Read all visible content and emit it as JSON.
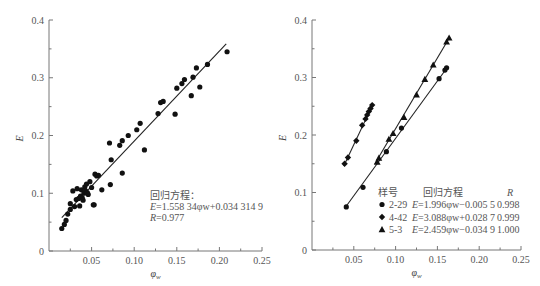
{
  "chart_data": [
    {
      "type": "scatter",
      "panel": "left",
      "title": "",
      "xlabel": "φw",
      "ylabel": "E",
      "xlim": [
        0,
        0.25
      ],
      "ylim": [
        0,
        0.4
      ],
      "xticks": [
        "0.05",
        "0.10",
        "0.15",
        "0.20",
        "0.25"
      ],
      "yticks": [
        "0",
        "0.1",
        "0.2",
        "0.3",
        "0.4"
      ],
      "grid": false,
      "series": [
        {
          "name": "data",
          "marker": "circle",
          "points": [
            [
              0.015,
              0.039
            ],
            [
              0.018,
              0.046
            ],
            [
              0.02,
              0.053
            ],
            [
              0.022,
              0.064
            ],
            [
              0.025,
              0.072
            ],
            [
              0.025,
              0.082
            ],
            [
              0.028,
              0.104
            ],
            [
              0.03,
              0.077
            ],
            [
              0.032,
              0.089
            ],
            [
              0.033,
              0.108
            ],
            [
              0.035,
              0.091
            ],
            [
              0.036,
              0.078
            ],
            [
              0.037,
              0.095
            ],
            [
              0.038,
              0.106
            ],
            [
              0.039,
              0.092
            ],
            [
              0.04,
              0.088
            ],
            [
              0.041,
              0.1
            ],
            [
              0.042,
              0.111
            ],
            [
              0.043,
              0.104
            ],
            [
              0.044,
              0.116
            ],
            [
              0.045,
              0.101
            ],
            [
              0.046,
              0.098
            ],
            [
              0.048,
              0.12
            ],
            [
              0.05,
              0.11
            ],
            [
              0.052,
              0.08
            ],
            [
              0.053,
              0.08
            ],
            [
              0.054,
              0.133
            ],
            [
              0.056,
              0.13
            ],
            [
              0.058,
              0.131
            ],
            [
              0.062,
              0.106
            ],
            [
              0.071,
              0.187
            ],
            [
              0.072,
              0.115
            ],
            [
              0.073,
              0.158
            ],
            [
              0.083,
              0.183
            ],
            [
              0.086,
              0.191
            ],
            [
              0.086,
              0.135
            ],
            [
              0.093,
              0.2
            ],
            [
              0.103,
              0.21
            ],
            [
              0.107,
              0.221
            ],
            [
              0.112,
              0.175
            ],
            [
              0.128,
              0.238
            ],
            [
              0.131,
              0.257
            ],
            [
              0.134,
              0.259
            ],
            [
              0.148,
              0.237
            ],
            [
              0.15,
              0.282
            ],
            [
              0.156,
              0.29
            ],
            [
              0.159,
              0.297
            ],
            [
              0.167,
              0.269
            ],
            [
              0.169,
              0.301
            ],
            [
              0.173,
              0.317
            ],
            [
              0.177,
              0.284
            ],
            [
              0.186,
              0.323
            ],
            [
              0.209,
              0.345
            ]
          ]
        }
      ],
      "fit_line": {
        "x": [
          0.015,
          0.208
        ],
        "slope": 1.55834,
        "intercept": 0.0343149
      },
      "annotations": {
        "title": "回归方程：",
        "equation_prefix": "E",
        "equation": "=1.558 34φw+0.034 314 9",
        "r_prefix": "R",
        "r_value": "=0.977"
      }
    },
    {
      "type": "scatter",
      "panel": "right",
      "title": "",
      "xlabel": "φw",
      "ylabel": "E",
      "xlim": [
        0,
        0.25
      ],
      "ylim": [
        0,
        0.4
      ],
      "xticks": [
        "0.05",
        "0.10",
        "0.15",
        "0.20",
        "0.25"
      ],
      "yticks": [
        "0",
        "0.1",
        "0.2",
        "0.3",
        "0.4"
      ],
      "grid": false,
      "series": [
        {
          "name": "2-29",
          "marker": "circle",
          "equation": "E=1.996φw−0.005 5",
          "R": "0.998",
          "points": [
            [
              0.041,
              0.075
            ],
            [
              0.061,
              0.109
            ],
            [
              0.089,
              0.171
            ],
            [
              0.107,
              0.212
            ],
            [
              0.152,
              0.298
            ],
            [
              0.159,
              0.313
            ],
            [
              0.161,
              0.317
            ]
          ],
          "fit_line": {
            "x": [
              0.04,
              0.162
            ],
            "slope": 1.996,
            "intercept": -0.0055
          }
        },
        {
          "name": "4-42",
          "marker": "diamond",
          "equation": "E=3.088φw+0.028 7",
          "R": "0.999",
          "points": [
            [
              0.039,
              0.15
            ],
            [
              0.043,
              0.161
            ],
            [
              0.053,
              0.19
            ],
            [
              0.06,
              0.217
            ],
            [
              0.064,
              0.228
            ],
            [
              0.066,
              0.235
            ],
            [
              0.068,
              0.241
            ],
            [
              0.07,
              0.246
            ],
            [
              0.072,
              0.252
            ]
          ],
          "fit_line": {
            "x": [
              0.038,
              0.073
            ],
            "slope": 3.088,
            "intercept": 0.0287
          }
        },
        {
          "name": "5-3",
          "marker": "triangle",
          "equation": "E=2.459φw−0.034 9",
          "R": "1.000",
          "points": [
            [
              0.078,
              0.153
            ],
            [
              0.08,
              0.16
            ],
            [
              0.092,
              0.193
            ],
            [
              0.097,
              0.203
            ],
            [
              0.11,
              0.231
            ],
            [
              0.125,
              0.27
            ],
            [
              0.135,
              0.297
            ],
            [
              0.145,
              0.322
            ],
            [
              0.161,
              0.362
            ],
            [
              0.164,
              0.369
            ]
          ],
          "fit_line": {
            "x": [
              0.075,
              0.165
            ],
            "slope": 2.459,
            "intercept": -0.0349
          }
        }
      ],
      "legend": {
        "header_sample": "样号",
        "header_equation": "回归方程",
        "header_r": "R",
        "position": "lower-right"
      }
    }
  ]
}
